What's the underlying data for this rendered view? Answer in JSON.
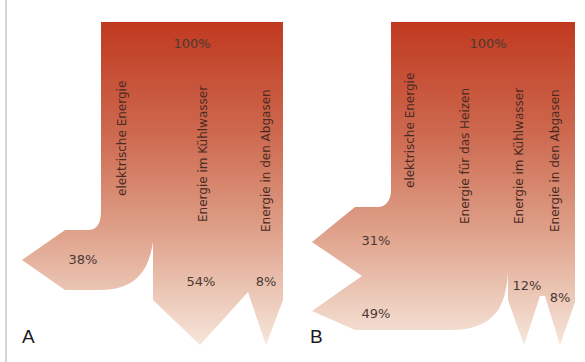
{
  "colors": {
    "top": "#c0391f",
    "mid": "#d98b74",
    "bottom": "#f4e2d6",
    "text": "#4a3a34"
  },
  "panels": [
    {
      "letter": "A",
      "input_label": "100%",
      "flows": [
        {
          "label": "elektrische Energie",
          "percent": "38%"
        },
        {
          "label": "Energie im Kühlwasser",
          "percent": "54%"
        },
        {
          "label": "Energie in den Abgasen",
          "percent": "8%"
        }
      ]
    },
    {
      "letter": "B",
      "input_label": "100%",
      "flows": [
        {
          "label": "elektrische Energie",
          "percent": "31%"
        },
        {
          "label": "Energie für das Heizen",
          "percent": "49%"
        },
        {
          "label": "Energie im Kühlwasser",
          "percent": "12%"
        },
        {
          "label": "Energie in den Abgasen",
          "percent": "8%"
        }
      ]
    }
  ]
}
